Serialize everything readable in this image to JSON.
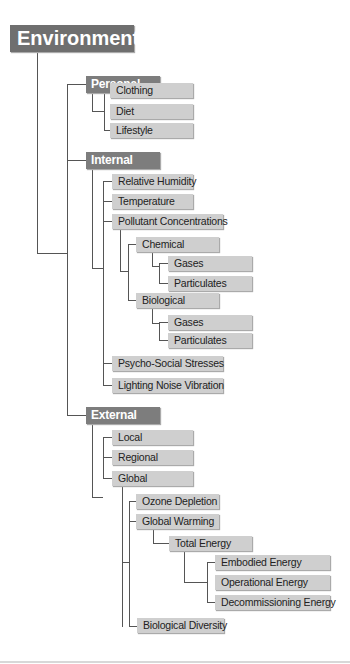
{
  "diagram": {
    "root": "Environment",
    "personal": {
      "label": "Personal",
      "children": [
        "Clothing",
        "Diet",
        "Lifestyle"
      ]
    },
    "internal": {
      "label": "Internal",
      "relative_humidity": "Relative Humidity",
      "temperature": "Temperature",
      "pollutant": {
        "label": "Pollutant Concentrations",
        "chemical": {
          "label": "Chemical",
          "children": [
            "Gases",
            "Particulates"
          ]
        },
        "biological": {
          "label": "Biological",
          "children": [
            "Gases",
            "Particulates"
          ]
        }
      },
      "psycho_social": "Psycho-Social Stresses",
      "lighting": "Lighting Noise Vibration"
    },
    "external": {
      "label": "External",
      "local": "Local",
      "regional": "Regional",
      "global": {
        "label": "Global",
        "ozone": "Ozone Depletion",
        "warming": {
          "label": "Global Warming",
          "total_energy": {
            "label": "Total Energy",
            "children": [
              "Embodied Energy",
              "Operational Energy",
              "Decommissioning Energy"
            ]
          }
        },
        "biodiversity": "Biological Diversity"
      }
    }
  }
}
